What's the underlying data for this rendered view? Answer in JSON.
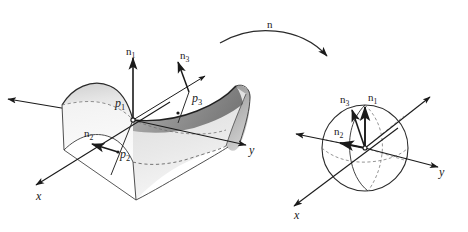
{
  "figure": {
    "stroke_color": "#1a1a1a",
    "surface_light": "#e8e8e8",
    "surface_mid": "#c9c9c9",
    "surface_dark": "#8f8f8f",
    "background": "#ffffff"
  },
  "map_arrow": {
    "label": "n",
    "name": "gauss-map-arrow",
    "direction": "left-to-right-curved"
  },
  "surface_panel": {
    "name": "saddle-surface-panel",
    "shape": "hyperbolic-paraboloid",
    "points": [
      {
        "id": "p1",
        "base": "p",
        "sub": "1"
      },
      {
        "id": "p2",
        "base": "p",
        "sub": "2"
      },
      {
        "id": "p3",
        "base": "p",
        "sub": "3"
      }
    ],
    "normals": [
      {
        "id": "n1",
        "base": "n",
        "sub": "1"
      },
      {
        "id": "n2",
        "base": "n",
        "sub": "2"
      },
      {
        "id": "n3",
        "base": "n",
        "sub": "3"
      }
    ],
    "axes": [
      {
        "id": "x",
        "label": "x"
      },
      {
        "id": "y",
        "label": "y"
      }
    ]
  },
  "sphere_panel": {
    "name": "unit-sphere-panel",
    "shape": "sphere",
    "normals": [
      {
        "id": "n1",
        "base": "n",
        "sub": "1"
      },
      {
        "id": "n2",
        "base": "n",
        "sub": "2"
      },
      {
        "id": "n3",
        "base": "n",
        "sub": "3"
      }
    ],
    "axes": [
      {
        "id": "x",
        "label": "x"
      },
      {
        "id": "y",
        "label": "y"
      }
    ]
  }
}
